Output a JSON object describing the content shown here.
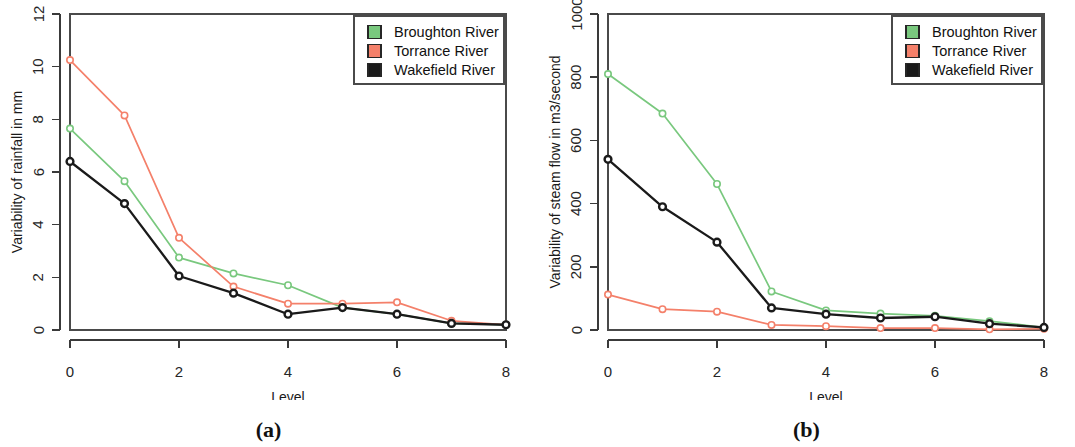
{
  "figure": {
    "panels": [
      {
        "id": "a",
        "caption": "(a)",
        "xlabel": "Level",
        "ylabel": "Variability of rainfall in mm"
      },
      {
        "id": "b",
        "caption": "(b)",
        "xlabel": "Level",
        "ylabel": "Variability of steam flow in m3/second"
      }
    ]
  },
  "colors": {
    "broughton": "#79c87e",
    "torrance": "#f4806a",
    "wakefield": "#1a1a1a",
    "broughton_swatch": "#79c87e",
    "torrance_swatch": "#f4806a",
    "wakefield_swatch": "#1a1a1a",
    "axis": "#3a3a3a",
    "frame": "#4a4a4a",
    "background": "#ffffff"
  },
  "legend": {
    "position": "top-right",
    "entries": [
      {
        "label": "Broughton River",
        "color": "#79c87e"
      },
      {
        "label": "Torrance River",
        "color": "#f4806a"
      },
      {
        "label": "Wakefield River",
        "color": "#1a1a1a"
      }
    ]
  },
  "chart_data": [
    {
      "type": "line",
      "panel": "a",
      "title": "",
      "xlabel": "Level",
      "ylabel": "Variability of rainfall in mm",
      "x": [
        0,
        1,
        2,
        3,
        4,
        5,
        6,
        7,
        8
      ],
      "xlim": [
        0,
        8
      ],
      "ylim": [
        0,
        12
      ],
      "xticks": [
        0,
        2,
        4,
        6,
        8
      ],
      "xtick_labels": [
        "0",
        "2",
        "4",
        "6",
        "8"
      ],
      "yticks": [
        0,
        2,
        4,
        6,
        8,
        10,
        12
      ],
      "ytick_labels": [
        "0",
        "2",
        "4",
        "6",
        "8",
        "10",
        "12"
      ],
      "grid": false,
      "legend_position": "top-right",
      "series": [
        {
          "name": "Broughton River",
          "color": "#79c87e",
          "values": [
            7.65,
            5.65,
            2.75,
            2.15,
            1.7,
            0.85,
            0.6,
            0.25,
            0.2
          ]
        },
        {
          "name": "Torrance River",
          "color": "#f4806a",
          "values": [
            10.25,
            8.15,
            3.5,
            1.65,
            1.0,
            1.0,
            1.05,
            0.35,
            0.2
          ]
        },
        {
          "name": "Wakefield River",
          "color": "#1a1a1a",
          "values": [
            6.4,
            4.8,
            2.05,
            1.4,
            0.6,
            0.85,
            0.6,
            0.25,
            0.2
          ]
        }
      ]
    },
    {
      "type": "line",
      "panel": "b",
      "title": "",
      "xlabel": "Level",
      "ylabel": "Variability of steam flow in m3/second",
      "x": [
        0,
        1,
        2,
        3,
        4,
        5,
        6,
        7,
        8
      ],
      "xlim": [
        0,
        8
      ],
      "ylim": [
        0,
        1000
      ],
      "xticks": [
        0,
        2,
        4,
        6,
        8
      ],
      "xtick_labels": [
        "0",
        "2",
        "4",
        "6",
        "8"
      ],
      "yticks": [
        0,
        200,
        400,
        600,
        800,
        1000
      ],
      "ytick_labels": [
        "0",
        "200",
        "400",
        "600",
        "800",
        "1000"
      ],
      "grid": false,
      "legend_position": "top-right",
      "series": [
        {
          "name": "Broughton River",
          "color": "#79c87e",
          "values": [
            810,
            685,
            462,
            122,
            62,
            52,
            45,
            28,
            8
          ]
        },
        {
          "name": "Torrance River",
          "color": "#f4806a",
          "values": [
            112,
            66,
            58,
            16,
            12,
            6,
            6,
            2,
            4
          ]
        },
        {
          "name": "Wakefield River",
          "color": "#1a1a1a",
          "values": [
            540,
            390,
            278,
            70,
            50,
            38,
            42,
            20,
            8
          ]
        }
      ]
    }
  ]
}
